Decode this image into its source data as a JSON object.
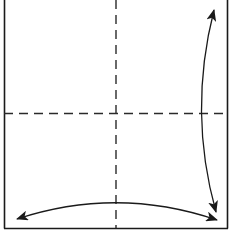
{
  "diagram": {
    "type": "origami-fold-diagram",
    "colors": {
      "background": "#ffffff",
      "stroke": "#1a1a1a",
      "dash": "#2a2a2a"
    },
    "paper": {
      "left": 4,
      "right": 228,
      "top": -2,
      "bottom": 228
    },
    "fold_lines": [
      {
        "name": "vertical-crease",
        "style": "dashed",
        "x": 116
      },
      {
        "name": "horizontal-crease",
        "style": "dashed",
        "y": 113
      }
    ],
    "arrows": [
      {
        "name": "right-vertical-fold-arrow",
        "direction": "double-headed",
        "from": [
          214,
          10
        ],
        "to": [
          216,
          212
        ]
      },
      {
        "name": "bottom-horizontal-fold-arrow",
        "direction": "double-headed",
        "from": [
          17,
          219
        ],
        "to": [
          217,
          220
        ]
      }
    ]
  }
}
